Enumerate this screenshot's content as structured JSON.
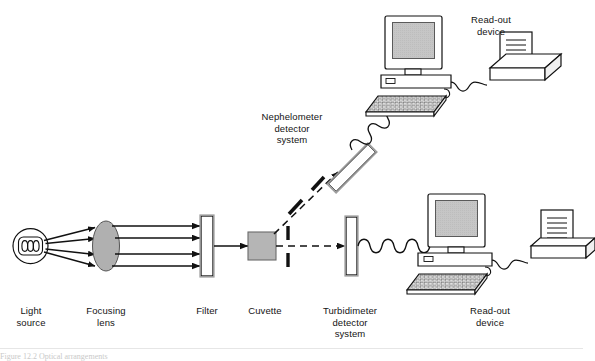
{
  "figure": {
    "caption_partial": "Figure  12.2   Optical arrangements"
  },
  "labels": {
    "light_source": "Light\nsource",
    "focusing_lens": "Focusing\nlens",
    "filter": "Filter",
    "cuvette": "Cuvette",
    "turbidimeter_detector": "Turbidimeter\ndetector\nsystem",
    "readout_bottom": "Read-out\ndevice",
    "nephelometer_detector": "Nephelometer\ndetector\nsystem",
    "readout_top": "Read-out\ndevice"
  },
  "components": {
    "light_source": {
      "name": "lamp-bulb",
      "filament_coils": 3
    },
    "focusing_lens": {
      "name": "biconvex-lens",
      "fill": "#b0b0b0"
    },
    "filter": {
      "name": "filter-slab",
      "fill": "#ffffff"
    },
    "cuvette": {
      "name": "cuvette-cell",
      "fill": "#b5b5b5"
    },
    "slits": {
      "name": "slit-pair",
      "count": 2
    },
    "angled_slits": {
      "name": "angled-slit-pair",
      "count": 2
    },
    "turbidimeter_detector": {
      "name": "detector-slab",
      "angle_deg": 0
    },
    "nephelometer_detector": {
      "name": "detector-slab-tilted",
      "angle_deg": 135
    },
    "monitors": 2,
    "keyboards": 2,
    "printers": 2,
    "coiled_cables": 2
  },
  "beams": {
    "rays_from_source": 4,
    "collimated_rays": 4,
    "scattered_beam_style": "dashed",
    "transmitted_beam_style": "dashed"
  },
  "colors": {
    "line": "#111111",
    "lens_fill": "#b0b0b0",
    "cuvette_fill": "#b5b5b5",
    "screen_fill": "#c4c4c4",
    "panel_fill": "#ffffff",
    "text": "#141414"
  }
}
